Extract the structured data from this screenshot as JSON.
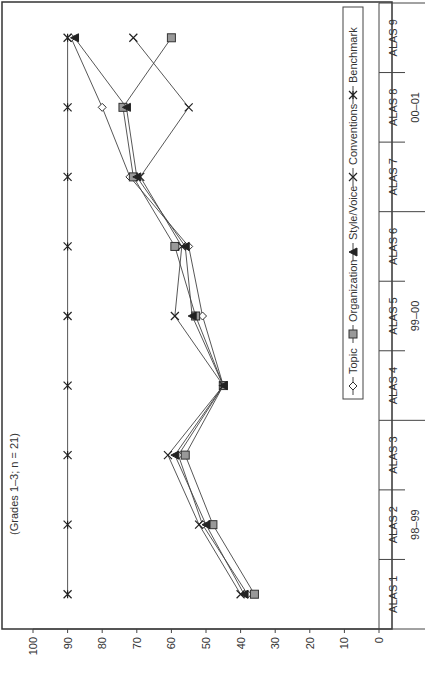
{
  "chart_data": {
    "type": "line",
    "title": "(Grades 1–3; n = 21)",
    "orientation": "rotated -90deg (landscape chart displayed portrait)",
    "xlabel": "",
    "ylabel": "",
    "ylim": [
      0,
      100
    ],
    "yticks": [
      0,
      10,
      20,
      30,
      40,
      50,
      60,
      70,
      80,
      90,
      100
    ],
    "categories": [
      "ALAS 1",
      "ALAS 2",
      "ALAS 3",
      "ALAS 4",
      "ALAS 5",
      "ALAS 6",
      "ALAS 7",
      "ALAS 8",
      "ALAS 9"
    ],
    "category_groups": [
      {
        "label": "98–99",
        "span": [
          0,
          2
        ]
      },
      {
        "label": "99–00",
        "span": [
          3,
          5
        ]
      },
      {
        "label": "00–01",
        "span": [
          6,
          8
        ]
      }
    ],
    "series": [
      {
        "name": "Topic",
        "marker": "diamond-open",
        "values": [
          38,
          51,
          58,
          45,
          51,
          55,
          72,
          80,
          89
        ]
      },
      {
        "name": "Organization",
        "marker": "square-gray",
        "values": [
          36,
          48,
          56,
          45,
          53,
          59,
          71,
          74,
          60
        ]
      },
      {
        "name": "Style/Voice",
        "marker": "triangle-filled",
        "values": [
          39,
          50,
          59,
          45,
          54,
          56,
          70,
          73,
          88
        ]
      },
      {
        "name": "Conventions",
        "marker": "x",
        "values": [
          40,
          52,
          61,
          45,
          59,
          57,
          69,
          55,
          71
        ]
      },
      {
        "name": "Benchmark",
        "marker": "asterisk",
        "values": [
          90,
          90,
          90,
          90,
          90,
          90,
          90,
          90,
          90
        ]
      }
    ],
    "grid": false,
    "legend_position": "top-right (inside plot)"
  },
  "legend": {
    "items": [
      "Topic",
      "Organization",
      "Style/Voice",
      "Conventions",
      "Benchmark"
    ]
  },
  "colors": {
    "line": "#333333",
    "organization_fill": "#999999",
    "axis": "#444444"
  }
}
